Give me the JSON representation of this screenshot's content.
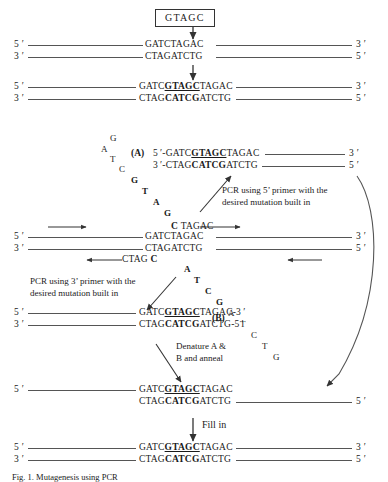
{
  "figure": {
    "caption": "Fig. 1. Mutagenesis using PCR"
  },
  "primer_box": {
    "label": "GTAGC"
  },
  "sequences": {
    "wt_top": {
      "pre": "GATCTAGAC"
    },
    "wt_bottom": {
      "pre": "CTAGATCTG"
    },
    "mut_top": {
      "a": "GATC",
      "mut": "GTAGC",
      "b": "TAGAC"
    },
    "mut_bottom": {
      "a": "CTAG",
      "mut": "CATCG",
      "b": "ATCTG"
    },
    "mut_top_3p": {
      "a": "GATC",
      "mut": "GTAGC",
      "b": "TAGAC",
      "suffix": "-3 ′"
    },
    "mut_bottom_5p": {
      "a": "CTAG",
      "mut": "CATCG",
      "b": "ATCTG",
      "suffix": "-5 ′"
    },
    "prefix5": "5 ′-",
    "prefix3": "3 ′-"
  },
  "end_labels": {
    "five": "5 ′",
    "three": "3 ′"
  },
  "panel_tags": {
    "a": "(A)",
    "b": "(B)"
  },
  "annotations": {
    "pcr5": "PCR using 5’ primer with the\ndesired mutation built in",
    "pcr5_line1": "PCR using 5’ primer with the",
    "pcr5_line2": "desired mutation built in",
    "pcr3_line1": "PCR using 3’ primer with the",
    "pcr3_line2": "desired mutation built in",
    "denature_line1": "Denature A &",
    "denature_line2": "B and anneal",
    "fill_in": "Fill in"
  },
  "overhang_top": {
    "mut": "C",
    "rest": "TAGAC"
  },
  "overhang_bottom": {
    "rest": "CTAG",
    "mut": "C"
  },
  "curve_a_letters": [
    {
      "ch": "G",
      "bold": false,
      "x": 110,
      "y": 133
    },
    {
      "ch": "A",
      "bold": false,
      "x": 101,
      "y": 144
    },
    {
      "ch": "T",
      "bold": false,
      "x": 110,
      "y": 154
    },
    {
      "ch": "C",
      "bold": false,
      "x": 119,
      "y": 164
    },
    {
      "ch": "G",
      "bold": true,
      "x": 131,
      "y": 175
    },
    {
      "ch": "T",
      "bold": true,
      "x": 142,
      "y": 186
    },
    {
      "ch": "A",
      "bold": true,
      "x": 153,
      "y": 197
    },
    {
      "ch": "G",
      "bold": true,
      "x": 164,
      "y": 208
    }
  ],
  "curve_b_letters": [
    {
      "ch": "A",
      "bold": true,
      "x": 184,
      "y": 264
    },
    {
      "ch": "T",
      "bold": true,
      "x": 194,
      "y": 275
    },
    {
      "ch": "C",
      "bold": true,
      "x": 205,
      "y": 286
    },
    {
      "ch": "G",
      "bold": true,
      "x": 216,
      "y": 297
    },
    {
      "ch": "A",
      "bold": false,
      "x": 228,
      "y": 308
    },
    {
      "ch": "T",
      "bold": false,
      "x": 240,
      "y": 319
    },
    {
      "ch": "C",
      "bold": false,
      "x": 251,
      "y": 330
    },
    {
      "ch": "T",
      "bold": false,
      "x": 262,
      "y": 341
    },
    {
      "ch": "G",
      "bold": false,
      "x": 273,
      "y": 352
    }
  ],
  "colors": {
    "ink": "#1a1a1a",
    "rule": "#555555",
    "arrow": "#333333",
    "box_border": "#333333"
  }
}
